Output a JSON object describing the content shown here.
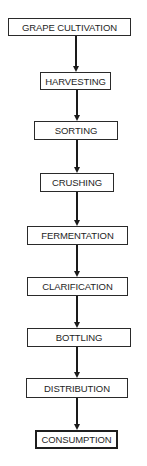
{
  "flowchart": {
    "steps": [
      {
        "label": "GRAPE CULTIVATION"
      },
      {
        "label": "HARVESTING"
      },
      {
        "label": "SORTING"
      },
      {
        "label": "CRUSHING"
      },
      {
        "label": "FERMENTATION"
      },
      {
        "label": "CLARIFICATION"
      },
      {
        "label": "BOTTLING"
      },
      {
        "label": "DISTRIBUTION"
      },
      {
        "label": "CONSUMPTION"
      }
    ],
    "colors": {
      "border": "#2a2a2a",
      "text": "#1e1e1e",
      "arrow": "#1a1a1a",
      "background": "#ffffff"
    }
  }
}
